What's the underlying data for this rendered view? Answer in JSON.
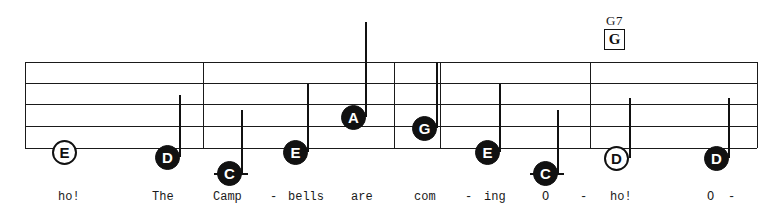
{
  "sheet": {
    "width": 780,
    "height": 217,
    "background": "#ffffff",
    "ink": "#111111"
  },
  "staff": {
    "left": 25,
    "right": 757,
    "line_ys": [
      62,
      83,
      104,
      126,
      148
    ],
    "line_count": 5
  },
  "barlines": [
    {
      "name": "barline-start",
      "x": 25
    },
    {
      "name": "barline-1",
      "x": 203
    },
    {
      "name": "barline-2",
      "x": 394
    },
    {
      "name": "barline-3",
      "x": 440
    },
    {
      "name": "barline-4",
      "x": 590
    },
    {
      "name": "barline-end",
      "x": 757
    }
  ],
  "chord": {
    "label": "G7",
    "box_letter": "G",
    "x": 604,
    "y": 14
  },
  "notes": [
    {
      "id": "note-1",
      "label": "E",
      "x": 64,
      "y": 152,
      "style": "open",
      "stem": null
    },
    {
      "id": "note-2",
      "label": "D",
      "x": 167,
      "y": 157,
      "style": "filled",
      "stem": {
        "x": 179,
        "top": 95,
        "bottom": 157
      }
    },
    {
      "id": "note-3",
      "label": "C",
      "x": 229,
      "y": 173,
      "style": "filled",
      "stem": {
        "x": 241,
        "top": 110,
        "bottom": 173
      },
      "ledger": {
        "x": 214,
        "y": 173,
        "width": 34
      }
    },
    {
      "id": "note-4",
      "label": "E",
      "x": 295,
      "y": 152,
      "style": "filled",
      "stem": {
        "x": 307,
        "top": 84,
        "bottom": 152
      }
    },
    {
      "id": "note-5",
      "label": "A",
      "x": 353,
      "y": 117,
      "style": "filled",
      "stem": {
        "x": 365,
        "top": 22,
        "bottom": 117
      }
    },
    {
      "id": "note-6",
      "label": "G",
      "x": 424,
      "y": 128,
      "style": "filled",
      "stem": {
        "x": 436,
        "top": 62,
        "bottom": 128
      }
    },
    {
      "id": "note-7",
      "label": "E",
      "x": 487,
      "y": 152,
      "style": "filled",
      "stem": {
        "x": 499,
        "top": 84,
        "bottom": 152
      }
    },
    {
      "id": "note-8",
      "label": "C",
      "x": 545,
      "y": 173,
      "style": "filled",
      "stem": {
        "x": 557,
        "top": 110,
        "bottom": 173
      },
      "ledger": {
        "x": 530,
        "y": 173,
        "width": 34
      }
    },
    {
      "id": "note-9",
      "label": "D",
      "x": 616,
      "y": 158,
      "style": "open",
      "stem": {
        "x": 629,
        "top": 98,
        "bottom": 158
      }
    },
    {
      "id": "note-10",
      "label": "D",
      "x": 716,
      "y": 158,
      "style": "filled",
      "stem": {
        "x": 728,
        "top": 98,
        "bottom": 158
      }
    }
  ],
  "lyrics": [
    {
      "text": "ho!",
      "x": 58
    },
    {
      "text": "The",
      "x": 152
    },
    {
      "text": "Camp",
      "x": 213
    },
    {
      "text": "-",
      "x": 270
    },
    {
      "text": "bells",
      "x": 288
    },
    {
      "text": "are",
      "x": 351
    },
    {
      "text": "com",
      "x": 414
    },
    {
      "text": "-",
      "x": 465
    },
    {
      "text": "ing",
      "x": 484
    },
    {
      "text": "O",
      "x": 542
    },
    {
      "text": "-",
      "x": 580
    },
    {
      "text": "ho!",
      "x": 610
    },
    {
      "text": "O",
      "x": 707
    },
    {
      "text": "-",
      "x": 728
    }
  ]
}
